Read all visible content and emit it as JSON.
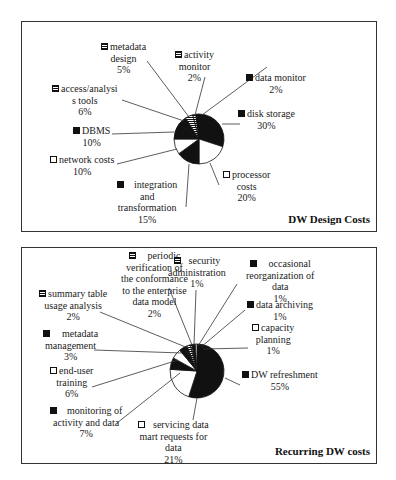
{
  "chart_data": [
    {
      "type": "pie",
      "title": "DW Design Costs",
      "start_angle": "12 o'clock, clockwise",
      "slices": [
        {
          "label": "disk storage",
          "value": 30,
          "fill": "black"
        },
        {
          "label": "processor costs",
          "value": 20,
          "fill": "white"
        },
        {
          "label": "integration and transformation",
          "value": 15,
          "fill": "black"
        },
        {
          "label": "network costs",
          "value": 10,
          "fill": "white"
        },
        {
          "label": "DBMS",
          "value": 10,
          "fill": "black"
        },
        {
          "label": "access/analysis tools",
          "value": 6,
          "fill": "black"
        },
        {
          "label": "metadata design",
          "value": 5,
          "fill": "pattern"
        },
        {
          "label": "activity monitor",
          "value": 2,
          "fill": "pattern"
        },
        {
          "label": "data monitor",
          "value": 2,
          "fill": "black"
        }
      ]
    },
    {
      "type": "pie",
      "title": "Recurring DW costs",
      "start_angle": "12 o'clock, clockwise",
      "slices": [
        {
          "label": "DW refreshment",
          "value": 55,
          "fill": "black"
        },
        {
          "label": "servicing data mart requests for data",
          "value": 21,
          "fill": "white"
        },
        {
          "label": "monitoring of activity and data",
          "value": 7,
          "fill": "black"
        },
        {
          "label": "end-user training",
          "value": 6,
          "fill": "white"
        },
        {
          "label": "metadata management",
          "value": 3,
          "fill": "black"
        },
        {
          "label": "summary table usage analysis",
          "value": 2,
          "fill": "black"
        },
        {
          "label": "periodic verification of the conformance to the enterprise data model",
          "value": 2,
          "fill": "pattern"
        },
        {
          "label": "security administration",
          "value": 1,
          "fill": "pattern"
        },
        {
          "label": "occasional reorganization of data",
          "value": 1,
          "fill": "black"
        },
        {
          "label": "data archiving",
          "value": 1,
          "fill": "black"
        },
        {
          "label": "capacity planning",
          "value": 1,
          "fill": "white"
        }
      ]
    }
  ],
  "chart1": {
    "title": "DW Design Costs",
    "labels": {
      "metadata_design": {
        "l1": "metadata",
        "l2": "design",
        "pct": "5%"
      },
      "activity_monitor": {
        "l1": "activity",
        "l2": "monitor",
        "pct": "2%"
      },
      "data_monitor": {
        "l1": "data monitor",
        "pct": "2%"
      },
      "access_tools": {
        "l1": "access/analysi",
        "l2": "s tools",
        "pct": "6%"
      },
      "disk_storage": {
        "l1": "disk storage",
        "pct": "30%"
      },
      "dbms": {
        "l1": "DBMS",
        "pct": "10%"
      },
      "network_costs": {
        "l1": "network costs",
        "pct": "10%"
      },
      "processor_costs": {
        "l1": "processor",
        "l2": "costs",
        "pct": "20%"
      },
      "integration": {
        "l1": "integration",
        "l2": "and",
        "l3": "transformation",
        "pct": "15%"
      }
    }
  },
  "chart2": {
    "title": "Recurring DW costs",
    "labels": {
      "periodic": {
        "l1": "periodic",
        "l2": "verification of",
        "l3": "the conformance",
        "l4": "to the enterprise",
        "l5": "data model",
        "pct": "2%"
      },
      "security": {
        "l1": "security",
        "l2": "administration",
        "pct": "1%"
      },
      "occasional": {
        "l1": "occasional",
        "l2": "reorganization of",
        "l3": "data",
        "pct": "1%"
      },
      "summary_table": {
        "l1": "summary table",
        "l2": "usage analysis",
        "pct": "2%"
      },
      "data_archiving": {
        "l1": "data archiving",
        "pct": "1%"
      },
      "capacity": {
        "l1": "capacity",
        "l2": "planning",
        "pct": "1%"
      },
      "metadata_mgmt": {
        "l1": "metadata",
        "l2": "management",
        "pct": "3%"
      },
      "end_user": {
        "l1": "end-user",
        "l2": "training",
        "pct": "6%"
      },
      "dw_refresh": {
        "l1": "DW refreshment",
        "pct": "55%"
      },
      "monitoring": {
        "l1": "monitoring of",
        "l2": "activity and data",
        "pct": "7%"
      },
      "servicing": {
        "l1": "servicing data",
        "l2": "mart requests for",
        "l3": "data",
        "pct": "21%"
      }
    }
  }
}
